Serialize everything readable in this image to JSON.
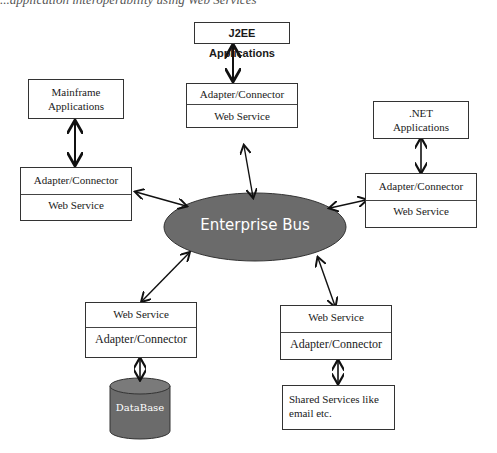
{
  "caption": "...application interoperability using Web Services",
  "bus": {
    "label": "Enterprise Bus",
    "color": "#6b6b6b"
  },
  "nodes": {
    "j2ee": {
      "app": "J2EE Applications",
      "top": "Adapter/Connector",
      "bottom": "Web Service"
    },
    "mainframe": {
      "app_line1": "Mainframe",
      "app_line2": "Applications",
      "top": "Adapter/Connector",
      "bottom": "Web Service"
    },
    "dotnet": {
      "app_line1": ".NET",
      "app_line2": "Applications",
      "top": "Adapter/Connector",
      "bottom": "Web Service"
    },
    "database": {
      "top": "Web Service",
      "bottom": "Adapter/Connector",
      "store": "DataBase"
    },
    "shared": {
      "top": "Web Service",
      "bottom": "Adapter/Connector",
      "service_line1": "Shared Services like",
      "service_line2": "email etc."
    }
  }
}
